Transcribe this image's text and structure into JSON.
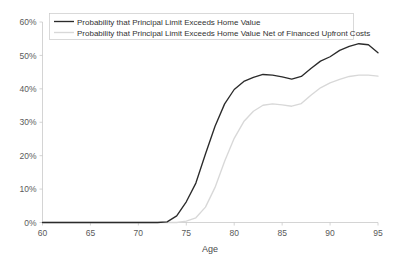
{
  "chart_data": {
    "type": "line",
    "title": "",
    "xlabel": "Age",
    "ylabel": "",
    "xlim": [
      60,
      95
    ],
    "ylim": [
      0,
      0.6
    ],
    "grid": false,
    "legend_position": "top-left",
    "x_ticks": [
      60,
      65,
      70,
      75,
      80,
      85,
      90,
      95
    ],
    "x_tick_labels": [
      "60",
      "65",
      "70",
      "75",
      "80",
      "85",
      "90",
      "95"
    ],
    "y_ticks": [
      0,
      0.1,
      0.2,
      0.3,
      0.4,
      0.5,
      0.6
    ],
    "y_tick_labels": [
      "0%",
      "10%",
      "20%",
      "30%",
      "40%",
      "50%",
      "60%"
    ],
    "x": [
      60,
      61,
      62,
      63,
      64,
      65,
      66,
      67,
      68,
      69,
      70,
      71,
      72,
      73,
      74,
      75,
      76,
      77,
      78,
      79,
      80,
      81,
      82,
      83,
      84,
      85,
      86,
      87,
      88,
      89,
      90,
      91,
      92,
      93,
      94,
      95
    ],
    "series": [
      {
        "name": "Probability that Principal Limit Exceeds Home Value",
        "color": "#2b2b2b",
        "values": [
          0.0,
          0.0,
          0.0,
          0.0,
          0.0,
          0.0,
          0.0,
          0.0,
          0.0,
          0.0,
          0.0,
          0.0,
          0.0,
          0.002,
          0.02,
          0.062,
          0.118,
          0.205,
          0.288,
          0.355,
          0.398,
          0.422,
          0.434,
          0.443,
          0.441,
          0.436,
          0.429,
          0.437,
          0.461,
          0.483,
          0.496,
          0.515,
          0.527,
          0.535,
          0.532,
          0.508
        ]
      },
      {
        "name": "Probability that Principal Limit Exceeds Home Value Net of Financed Upfront Costs",
        "color": "#d8d8d8",
        "values": [
          0.0,
          0.0,
          0.0,
          0.0,
          0.0,
          0.0,
          0.0,
          0.0,
          0.0,
          0.0,
          0.0,
          0.0,
          0.0,
          0.0,
          0.0,
          0.004,
          0.014,
          0.046,
          0.105,
          0.183,
          0.252,
          0.302,
          0.333,
          0.351,
          0.355,
          0.352,
          0.348,
          0.356,
          0.381,
          0.403,
          0.418,
          0.428,
          0.437,
          0.441,
          0.441,
          0.438
        ]
      }
    ]
  },
  "axes": {
    "x_axis_label": "Age"
  },
  "legend": {
    "entries": [
      {
        "label": "Probability that Principal Limit Exceeds Home Value"
      },
      {
        "label": "Probability that Principal Limit Exceeds Home Value Net of Financed Upfront Costs"
      }
    ]
  },
  "colors": {
    "background": "#ffffff",
    "axis": "#c9c9c9",
    "series_primary": "#2b2b2b",
    "series_secondary": "#d8d8d8",
    "tick_text": "#5a5a5a",
    "legend_text": "#333333"
  }
}
